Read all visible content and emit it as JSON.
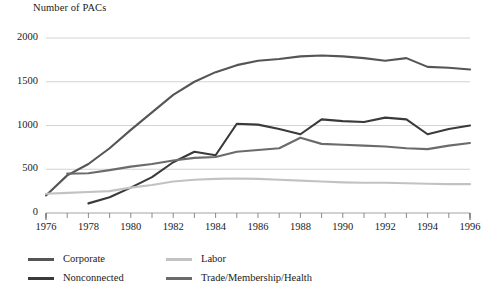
{
  "chart_data": {
    "type": "line",
    "title": "Number of PACs",
    "xlabel": "",
    "ylabel": "Number of PACs",
    "grid": true,
    "legend_position": "bottom-left",
    "xlim": [
      1976,
      1996
    ],
    "ylim": [
      0,
      2000
    ],
    "yticks": [
      0,
      500,
      1000,
      1500,
      2000
    ],
    "ytick_labels": [
      "0",
      "500",
      "1000",
      "1500",
      "2000"
    ],
    "x": [
      1976,
      1977,
      1978,
      1979,
      1980,
      1981,
      1982,
      1983,
      1984,
      1985,
      1986,
      1987,
      1988,
      1989,
      1990,
      1991,
      1992,
      1993,
      1994,
      1995,
      1996
    ],
    "xticks": [
      1976,
      1977,
      1978,
      1979,
      1980,
      1981,
      1982,
      1983,
      1984,
      1985,
      1986,
      1987,
      1988,
      1989,
      1990,
      1991,
      1992,
      1993,
      1994,
      1995,
      1996
    ],
    "xtick_labels": [
      "1976",
      "",
      "1978",
      "",
      "1980",
      "",
      "1982",
      "",
      "1984",
      "",
      "1986",
      "",
      "1988",
      "",
      "1990",
      "",
      "1992",
      "",
      "1994",
      "",
      "1996"
    ],
    "series": [
      {
        "name": "Corporate",
        "color": "#555555",
        "x": [
          1976,
          1977,
          1978,
          1979,
          1980,
          1981,
          1982,
          1983,
          1984,
          1985,
          1986,
          1987,
          1988,
          1989,
          1990,
          1991,
          1992,
          1993,
          1994,
          1995,
          1996
        ],
        "values": [
          200,
          430,
          560,
          740,
          950,
          1150,
          1350,
          1500,
          1610,
          1690,
          1740,
          1760,
          1790,
          1800,
          1790,
          1770,
          1740,
          1770,
          1670,
          1660,
          1640
        ]
      },
      {
        "name": "Nonconnected",
        "color": "#3a3a3a",
        "x": [
          1978,
          1979,
          1980,
          1981,
          1982,
          1983,
          1984,
          1985,
          1986,
          1987,
          1988,
          1989,
          1990,
          1991,
          1992,
          1993,
          1994,
          1995,
          1996
        ],
        "values": [
          110,
          180,
          290,
          410,
          580,
          700,
          660,
          1020,
          1010,
          960,
          900,
          1070,
          1050,
          1040,
          1090,
          1070,
          900,
          960,
          1000
        ]
      },
      {
        "name": "Labor",
        "color": "#c2c2c2",
        "x": [
          1976,
          1977,
          1978,
          1979,
          1980,
          1981,
          1982,
          1983,
          1984,
          1985,
          1986,
          1987,
          1988,
          1989,
          1990,
          1991,
          1992,
          1993,
          1994,
          1995,
          1996
        ],
        "values": [
          220,
          230,
          240,
          250,
          290,
          320,
          360,
          380,
          390,
          395,
          390,
          380,
          370,
          360,
          350,
          345,
          345,
          340,
          335,
          330,
          330
        ]
      },
      {
        "name": "Trade/Membership/Health",
        "color": "#6b6b6b",
        "x": [
          1977,
          1978,
          1979,
          1980,
          1981,
          1982,
          1983,
          1984,
          1985,
          1986,
          1987,
          1988,
          1989,
          1990,
          1991,
          1992,
          1993,
          1994,
          1995,
          1996
        ],
        "values": [
          450,
          455,
          490,
          530,
          560,
          600,
          630,
          640,
          700,
          720,
          740,
          860,
          790,
          780,
          770,
          760,
          740,
          730,
          770,
          800
        ]
      }
    ]
  },
  "legend": {
    "items": [
      {
        "label": "Corporate",
        "color": "#555555"
      },
      {
        "label": "Labor",
        "color": "#c2c2c2"
      },
      {
        "label": "Nonconnected",
        "color": "#3a3a3a"
      },
      {
        "label": "Trade/Membership/Health",
        "color": "#6b6b6b"
      }
    ]
  },
  "axes": {
    "y_title": "Number of PACs"
  }
}
